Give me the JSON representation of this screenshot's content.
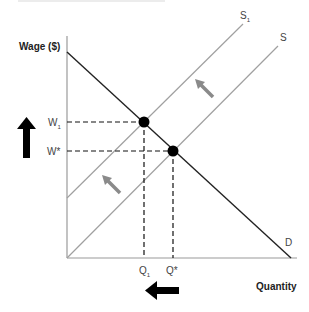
{
  "diagram": {
    "type": "supply-demand",
    "y_axis_label": "Wage ($)",
    "x_axis_label": "Quantity",
    "curves": {
      "demand": {
        "label": "D"
      },
      "supply": {
        "label": "S"
      },
      "supply_shifted": {
        "label": "S",
        "subscript": "1"
      }
    },
    "y_ticks": {
      "w1": {
        "label": "W",
        "subscript": "1"
      },
      "wstar": {
        "label": "W*"
      }
    },
    "x_ticks": {
      "q1": {
        "label": "Q",
        "subscript": "1"
      },
      "qstar": {
        "label": "Q*"
      }
    },
    "arrows": {
      "wage_change": "up",
      "quantity_change": "left",
      "supply_shift": "up-left"
    },
    "colors": {
      "demand": "#222222",
      "supply": "#9a9a9a",
      "shift_arrow": "#8a8a8a",
      "points": "#000000"
    }
  }
}
